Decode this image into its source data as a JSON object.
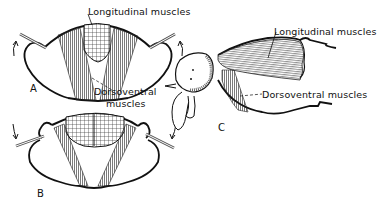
{
  "figure": {
    "panels": [
      {
        "id": "A",
        "letter": "A",
        "labels": {
          "longitudinal": "Longitudinal muscles",
          "dorsoventral_line1": "Dorsoventral",
          "dorsoventral_line2": "muscles"
        },
        "wing_motion": "up"
      },
      {
        "id": "B",
        "letter": "B",
        "wing_motion": "down"
      },
      {
        "id": "C",
        "letter": "C",
        "labels": {
          "longitudinal": "Longitudinal muscles",
          "dorsoventral": "Dorsoventral muscles"
        }
      }
    ]
  },
  "colors": {
    "ink": "#111111",
    "background": "#ffffff"
  }
}
